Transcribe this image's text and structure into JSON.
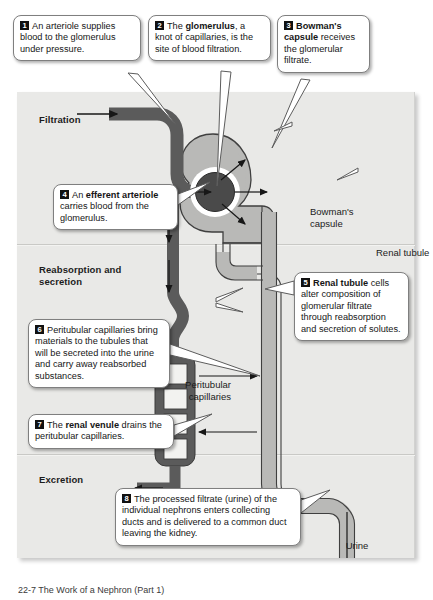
{
  "figure": {
    "caption": "22-7 The Work of a Nephron (Part 1)"
  },
  "panel": {
    "sections": [
      {
        "id": "filtration",
        "label": "Filtration"
      },
      {
        "id": "reabsorption",
        "label": "Reabsorption and secretion"
      },
      {
        "id": "excretion",
        "label": "Excretion"
      }
    ]
  },
  "diagram_labels": [
    {
      "id": "bowmans-capsule",
      "text": "Bowman's capsule"
    },
    {
      "id": "renal-tubule",
      "text": "Renal tubule"
    },
    {
      "id": "peritubular-capillaries",
      "text": "Peritubular capillaries"
    },
    {
      "id": "urine",
      "text": "Urine"
    }
  ],
  "callouts": [
    {
      "number": "1",
      "lead": "An arteriole supplies blood to the glomerulus under pressure.",
      "parts": [
        {
          "text": "An arteriole supplies blood to the glomerulus under pressure.",
          "bold": false
        }
      ]
    },
    {
      "number": "2",
      "lead": "The glomerulus, a knot of capillaries, is the site of blood filtration.",
      "parts": [
        {
          "text": "The ",
          "bold": false
        },
        {
          "text": "glomerulus",
          "bold": true
        },
        {
          "text": ", a knot of capillaries, is the site of blood filtration.",
          "bold": false
        }
      ]
    },
    {
      "number": "3",
      "lead": "Bowman's capsule receives the glomerular filtrate.",
      "parts": [
        {
          "text": "Bowman's capsule",
          "bold": true
        },
        {
          "text": " receives the glomerular filtrate.",
          "bold": false
        }
      ]
    },
    {
      "number": "4",
      "lead": "An efferent arteriole carries blood from the glomerulus.",
      "parts": [
        {
          "text": "An ",
          "bold": false
        },
        {
          "text": "efferent arteriole",
          "bold": true
        },
        {
          "text": " carries blood from the glomerulus.",
          "bold": false
        }
      ]
    },
    {
      "number": "5",
      "lead": "Renal tubule cells alter composition of glomerular filtrate through reabsorption and secretion of solutes.",
      "parts": [
        {
          "text": "Renal tubule",
          "bold": true
        },
        {
          "text": " cells alter composition of glomerular filtrate through reabsorption and secretion of solutes.",
          "bold": false
        }
      ]
    },
    {
      "number": "6",
      "lead": "Peritubular capillaries bring materials to the tubules that will be secreted into the urine and carry away reabsorbed substances.",
      "parts": [
        {
          "text": "Peritubular capillaries bring materials to the tubules that will be secreted into the urine and carry away reabsorbed substances.",
          "bold": false
        }
      ]
    },
    {
      "number": "7",
      "lead": "The renal venule drains the peritubular capillaries.",
      "parts": [
        {
          "text": "The ",
          "bold": false
        },
        {
          "text": "renal venule",
          "bold": true
        },
        {
          "text": " drains the peritubular capillaries.",
          "bold": false
        }
      ]
    },
    {
      "number": "8",
      "lead": "The processed filtrate (urine) of the individual nephrons enters collecting ducts and is delivered to a common duct leaving the kidney.",
      "parts": [
        {
          "text": "The processed filtrate (urine) of the individual nephrons enters collecting ducts and is delivered to a common duct leaving the kidney.",
          "bold": false
        }
      ]
    }
  ],
  "colors": {
    "panel_background": "#e9e9e7",
    "vessel_dark": "#5b5b5b",
    "glomerulus_dark": "#4a4a4a",
    "tubule_light": "#b9b9b7",
    "capsule_light": "#b9b9b7",
    "outline": "#3a3a3a",
    "callout_background": "#ffffff",
    "callout_border": "#7f7f7f",
    "number_badge": "#111111",
    "text": "#161616"
  }
}
